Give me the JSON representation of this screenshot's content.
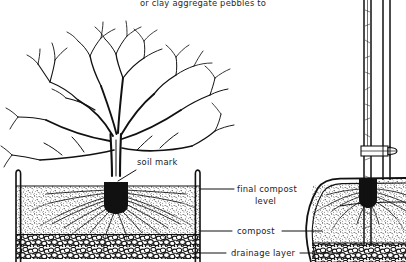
{
  "figure": {
    "type": "line-drawing",
    "background_color": "#ffffff",
    "ink_color": "#111111",
    "caption_top": "or clay aggregate pebbles to"
  },
  "labels": {
    "soil_mark": "soil mark",
    "final_compost_level_line1": "final compost",
    "final_compost_level_line2": "level",
    "compost": "compost",
    "drainage_layer": "drainage layer"
  },
  "scene": {
    "left_container": {
      "name": "planting container cross-section",
      "layers": [
        "compost",
        "drainage layer"
      ],
      "plant": "bare-root deciduous tree with fibrous root system"
    },
    "right_container": {
      "name": "second container cross-section with stake",
      "stake": "vertical cane stake",
      "tie": "tree tie with buckle spacer"
    }
  }
}
